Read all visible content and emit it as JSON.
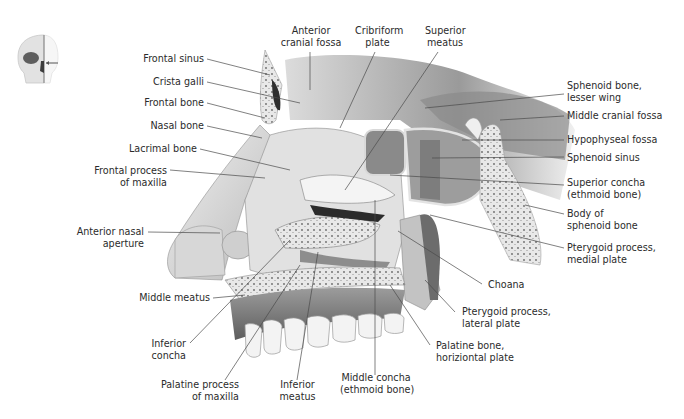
{
  "figure": {
    "orientation_icon": "skull-orientation-icon",
    "colors": {
      "background": "#ffffff",
      "label_text": "#2b2b2b",
      "leader_line": "#4a4a4a",
      "bone_light": "#ececec",
      "bone_mid": "#bdbdbd",
      "bone_dark": "#6e6e6e"
    }
  },
  "labels": {
    "left": [
      {
        "id": "frontal-sinus",
        "lines": [
          "Frontal sinus"
        ]
      },
      {
        "id": "crista-galli",
        "lines": [
          "Crista galli"
        ]
      },
      {
        "id": "frontal-bone",
        "lines": [
          "Frontal bone"
        ]
      },
      {
        "id": "nasal-bone",
        "lines": [
          "Nasal bone"
        ]
      },
      {
        "id": "lacrimal-bone",
        "lines": [
          "Lacrimal bone"
        ]
      },
      {
        "id": "frontal-process-maxilla",
        "lines": [
          "Frontal process",
          "of maxilla"
        ]
      },
      {
        "id": "anterior-nasal-aperture",
        "lines": [
          "Anterior nasal",
          "aperture"
        ]
      },
      {
        "id": "middle-meatus",
        "lines": [
          "Middle meatus"
        ]
      },
      {
        "id": "inferior-concha",
        "lines": [
          "Inferior",
          "concha"
        ]
      }
    ],
    "top": [
      {
        "id": "anterior-cranial-fossa",
        "lines": [
          "Anterior",
          "cranial fossa"
        ]
      },
      {
        "id": "cribriform-plate",
        "lines": [
          "Cribriform",
          "plate"
        ]
      },
      {
        "id": "superior-meatus",
        "lines": [
          "Superior",
          "meatus"
        ]
      }
    ],
    "right": [
      {
        "id": "sphenoid-lesser-wing",
        "lines": [
          "Sphenoid bone,",
          "lesser wing"
        ]
      },
      {
        "id": "middle-cranial-fossa",
        "lines": [
          "Middle cranial fossa"
        ]
      },
      {
        "id": "hypophyseal-fossa",
        "lines": [
          "Hypophyseal fossa"
        ]
      },
      {
        "id": "sphenoid-sinus",
        "lines": [
          "Sphenoid sinus"
        ]
      },
      {
        "id": "superior-concha",
        "lines": [
          "Superior concha",
          "(ethmoid bone)"
        ]
      },
      {
        "id": "body-sphenoid",
        "lines": [
          "Body of",
          "sphenoid bone"
        ]
      },
      {
        "id": "pterygoid-medial",
        "lines": [
          "Pterygoid process,",
          "medial plate"
        ]
      },
      {
        "id": "choana",
        "lines": [
          "Choana"
        ]
      },
      {
        "id": "pterygoid-lateral",
        "lines": [
          "Pterygoid process,",
          "lateral plate"
        ]
      },
      {
        "id": "palatine-horizontal",
        "lines": [
          "Palatine bone,",
          "horiziontal plate"
        ]
      }
    ],
    "bottom": [
      {
        "id": "palatine-process-maxilla",
        "lines": [
          "Palatine process",
          "of maxilla"
        ]
      },
      {
        "id": "inferior-meatus",
        "lines": [
          "Inferior",
          "meatus"
        ]
      },
      {
        "id": "middle-concha",
        "lines": [
          "Middle concha",
          "(ethmoid bone)"
        ]
      }
    ]
  }
}
